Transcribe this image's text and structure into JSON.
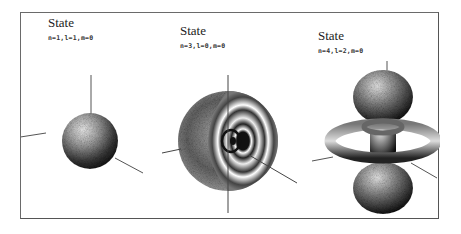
{
  "figure": {
    "panels": [
      {
        "title": "State",
        "quantum_numbers": "n=1,l=1,m=0",
        "shape": "solid-sphere"
      },
      {
        "title": "State",
        "quantum_numbers": "n=3,l=0,m=0",
        "shape": "cutaway-sphere-with-nodal-shells"
      },
      {
        "title": "State",
        "quantum_numbers": "n=4,l=2,m=0",
        "shape": "dz2-lobes-with-tori"
      }
    ],
    "colors": {
      "frame": "#6a6a6a",
      "axis": "#555555",
      "shade_dark": "#111111",
      "shade_light": "#f2f2f2"
    }
  }
}
